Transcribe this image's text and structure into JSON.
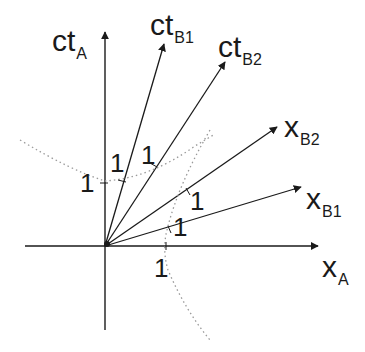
{
  "diagram": {
    "axes": {
      "ct_A": {
        "main": "ct",
        "sub": "A"
      },
      "x_A": {
        "main": "x",
        "sub": "A"
      },
      "ct_B1": {
        "main": "ct",
        "sub": "B1"
      },
      "ct_B2": {
        "main": "ct",
        "sub": "B2"
      },
      "x_B1": {
        "main": "x",
        "sub": "B1"
      },
      "x_B2": {
        "main": "x",
        "sub": "B2"
      }
    },
    "unit_marks": {
      "ct_A": "1",
      "ct_B1": "1",
      "ct_B2": "1",
      "x_A": "1",
      "x_B1": "1",
      "x_B2": "1"
    },
    "hyperbolas": [
      "timelike invariant hyperbola (dotted)",
      "spacelike invariant hyperbola (dotted)"
    ],
    "colors": {
      "line": "#1a1a1a",
      "dotted": "#9a9a9a",
      "background": "#ffffff"
    }
  }
}
